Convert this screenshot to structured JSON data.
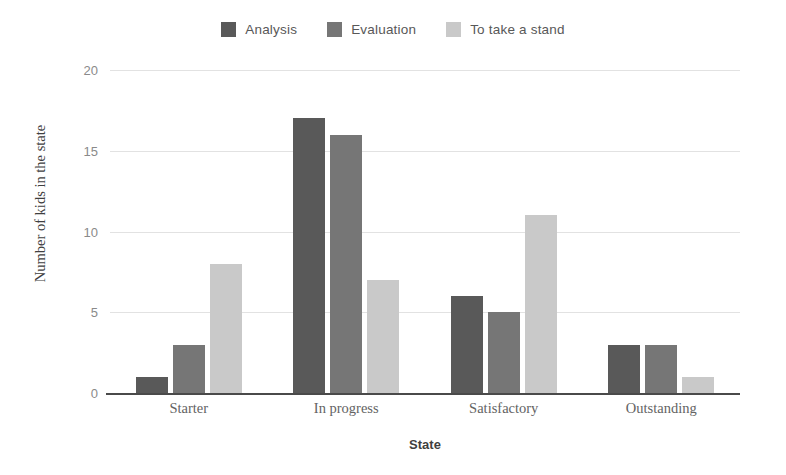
{
  "chart_data": {
    "type": "bar",
    "title": "",
    "xlabel": "State",
    "ylabel": "Number of kids in the state",
    "categories": [
      "Starter",
      "In progress",
      "Satisfactory",
      "Outstanding"
    ],
    "series": [
      {
        "name": "Analysis",
        "color": "#595959",
        "values": [
          1,
          17,
          6,
          3
        ]
      },
      {
        "name": "Evaluation",
        "color": "#767676",
        "values": [
          3,
          16,
          5,
          3
        ]
      },
      {
        "name": "To take a stand",
        "color": "#c9c9c9",
        "values": [
          8,
          7,
          11,
          1
        ]
      }
    ],
    "ylim": [
      0,
      20
    ],
    "yticks": [
      0,
      5,
      10,
      15,
      20
    ],
    "ytick_labels": [
      "0",
      "5",
      "10",
      "15",
      "20"
    ],
    "grid": true,
    "grid_axis": "y",
    "legend_position": "top-center",
    "background_color": "#ffffff",
    "gridline_color": "#e2e2e2",
    "axis_color": "#4a4a4a"
  }
}
